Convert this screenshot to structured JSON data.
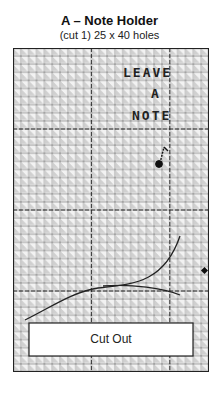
{
  "header": {
    "title": "A – Note Holder",
    "subtitle": "(cut 1) 25 x 40 holes"
  },
  "canvas": {
    "columns": 25,
    "rows": 40,
    "guide_interval": 10,
    "grid_color": "#333333",
    "hole_shade_color": "#c8c8c8",
    "stitch_color": "#222222"
  },
  "stitched_text": {
    "line1": "LEAVE",
    "line2": "A",
    "line3": "NOTE"
  },
  "decorations": {
    "music_note": "music-note",
    "right_edge_marker": "dot"
  },
  "cutout": {
    "label": "Cut Out"
  }
}
